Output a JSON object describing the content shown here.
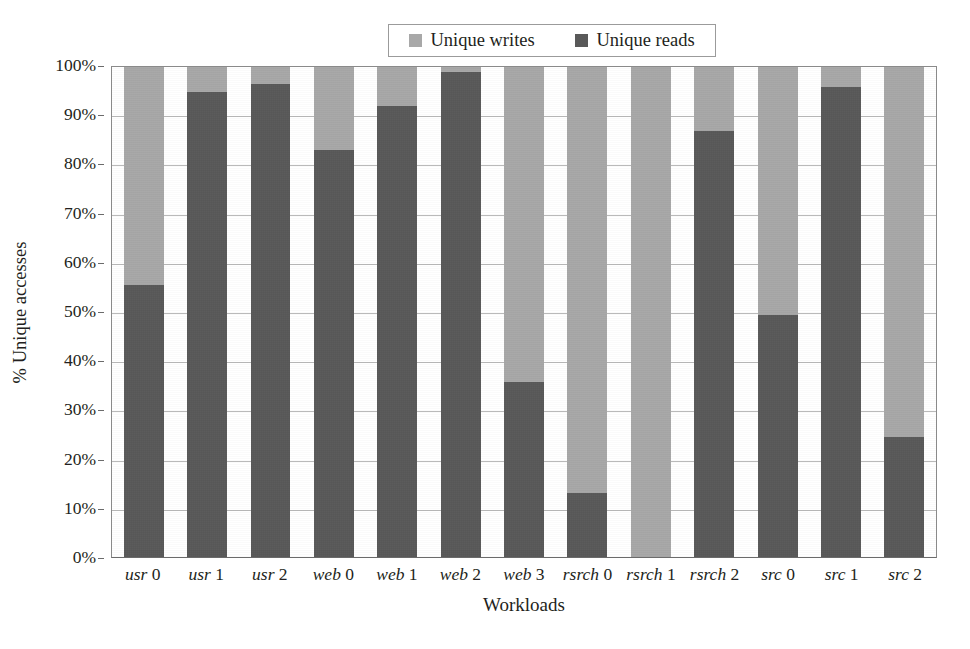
{
  "chart_data": {
    "type": "bar",
    "subtype": "stacked-100-percent",
    "title": "",
    "xlabel": "Workloads",
    "ylabel": "% Unique accesses",
    "ylim": [
      0,
      100
    ],
    "ytick_labels": [
      "0%",
      "10%",
      "20%",
      "30%",
      "40%",
      "50%",
      "60%",
      "70%",
      "80%",
      "90%",
      "100%"
    ],
    "ytick_values": [
      0,
      10,
      20,
      30,
      40,
      50,
      60,
      70,
      80,
      90,
      100
    ],
    "grid": true,
    "legend_position": "top-center",
    "categories": [
      {
        "name": "usr",
        "num": "0",
        "label": "usr 0"
      },
      {
        "name": "usr",
        "num": "1",
        "label": "usr 1"
      },
      {
        "name": "usr",
        "num": "2",
        "label": "usr 2"
      },
      {
        "name": "web",
        "num": "0",
        "label": "web 0"
      },
      {
        "name": "web",
        "num": "1",
        "label": "web 1"
      },
      {
        "name": "web",
        "num": "2",
        "label": "web 2"
      },
      {
        "name": "web",
        "num": "3",
        "label": "web 3"
      },
      {
        "name": "rsrch",
        "num": "0",
        "label": "rsrch 0"
      },
      {
        "name": "rsrch",
        "num": "1",
        "label": "rsrch 1"
      },
      {
        "name": "rsrch",
        "num": "2",
        "label": "rsrch 2"
      },
      {
        "name": "src",
        "num": "0",
        "label": "src 0"
      },
      {
        "name": "src",
        "num": "1",
        "label": "src 1"
      },
      {
        "name": "src",
        "num": "2",
        "label": "src 2"
      }
    ],
    "series": [
      {
        "name": "Unique reads",
        "color": "#595959",
        "values": [
          55.5,
          95.0,
          96.5,
          83.0,
          92.0,
          99.0,
          35.8,
          13.0,
          0.0,
          87.0,
          49.3,
          96.0,
          24.4
        ]
      },
      {
        "name": "Unique writes",
        "color": "#a8a8a8",
        "values": [
          44.5,
          5.0,
          3.5,
          17.0,
          8.0,
          1.0,
          64.2,
          87.0,
          100.0,
          13.0,
          50.7,
          4.0,
          75.6
        ]
      }
    ]
  },
  "legend": {
    "entries": [
      {
        "label": "Unique writes",
        "color": "#a8a8a8",
        "swatch_name": "legend-swatch-unique-writes"
      },
      {
        "label": "Unique reads",
        "color": "#595959",
        "swatch_name": "legend-swatch-unique-reads"
      }
    ]
  },
  "colors": {
    "unique_writes": "#a8a8a8",
    "unique_reads": "#595959",
    "gridline": "#b9b9b9",
    "axis": "#6b6b6b",
    "text": "#231f20",
    "background": "#ffffff"
  }
}
